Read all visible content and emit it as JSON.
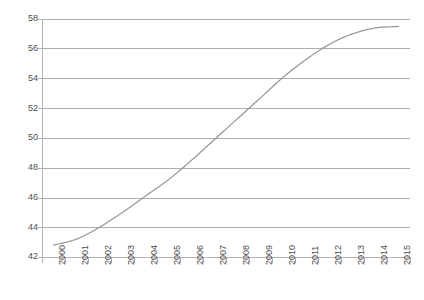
{
  "chart_data": {
    "type": "line",
    "title": "",
    "subtitle": "",
    "xlabel": "",
    "ylabel": "",
    "categories": [
      "2000",
      "2001",
      "2002",
      "2003",
      "2004",
      "2005",
      "2006",
      "2007",
      "2008",
      "2009",
      "2010",
      "2011",
      "2012",
      "2013",
      "2014",
      "2015"
    ],
    "series": [
      {
        "name": "",
        "color": "#969696",
        "values": [
          42.8,
          43.2,
          44.0,
          45.0,
          46.1,
          47.2,
          48.5,
          49.9,
          51.3,
          52.7,
          54.1,
          55.3,
          56.3,
          57.0,
          57.4,
          57.5
        ]
      }
    ],
    "ylim": [
      42,
      58
    ],
    "ytick_values": [
      42,
      44,
      46,
      48,
      50,
      52,
      54,
      56,
      58
    ],
    "ytick_labels": [
      "42",
      "44",
      "46",
      "48",
      "50",
      "52",
      "54",
      "56",
      "58"
    ],
    "grid": true,
    "grid_axis": "y",
    "legend": false,
    "legend_position": "none",
    "xtick_rotation": -90,
    "annotations": []
  },
  "colors": {
    "series_line": "#969696",
    "gridline": "#aeaeae",
    "axis": "#b3b3b3",
    "tick_text": "#4d4d4d",
    "background": "#ffffff"
  }
}
